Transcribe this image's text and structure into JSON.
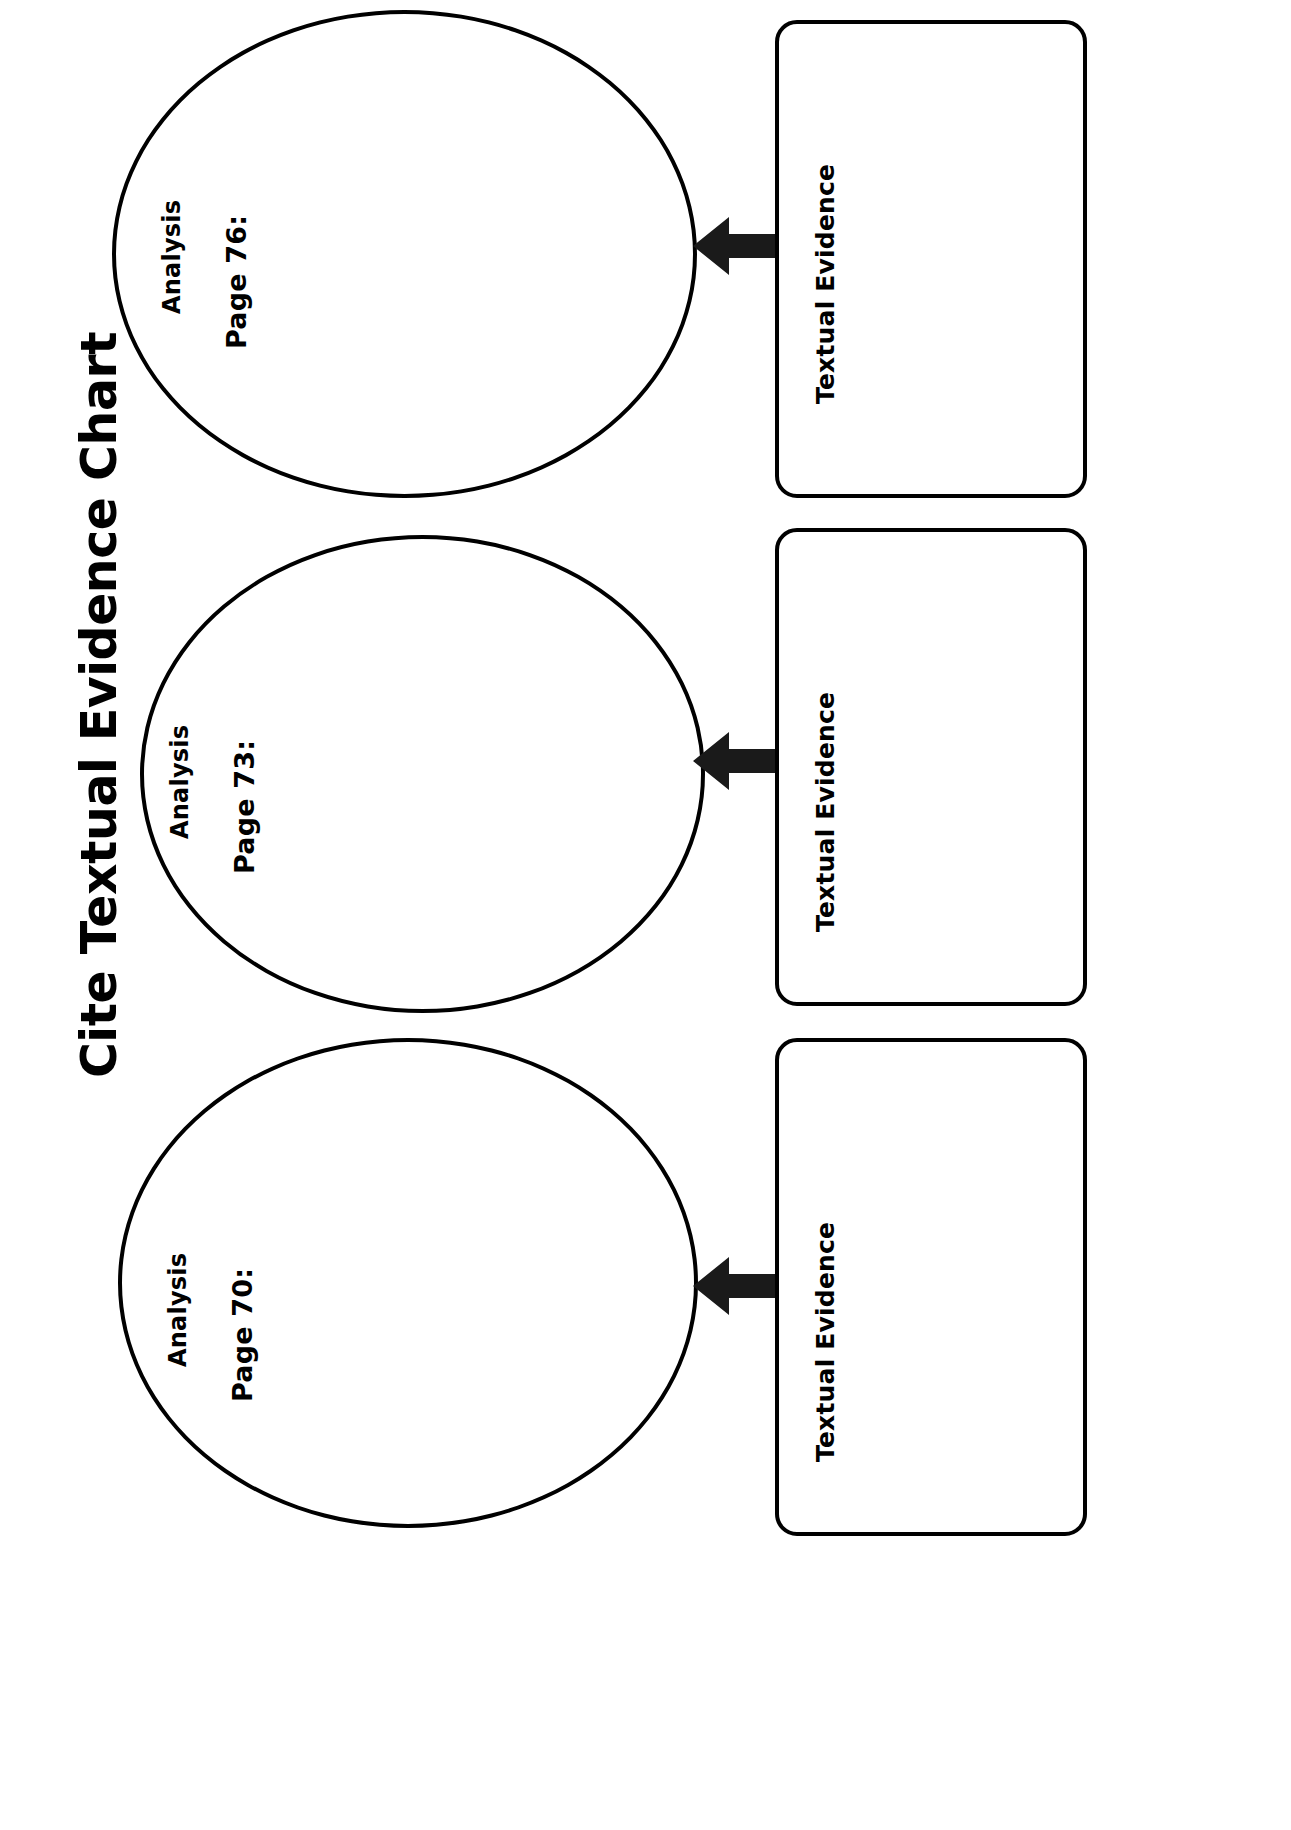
{
  "page": {
    "title": "Cite Textual Evidence Chart",
    "orientation": "rotated-90",
    "background_color": "#ffffff",
    "ink_color": "#000000"
  },
  "groups": [
    {
      "id": "group-page-70",
      "ellipse": {
        "heading": "Analysis",
        "page_label": "Page 70:",
        "content": ""
      },
      "evidence_box": {
        "label": "Textual Evidence",
        "content": ""
      },
      "arrow": {
        "icon": "arrow-left-icon",
        "direction": "left"
      }
    },
    {
      "id": "group-page-73",
      "ellipse": {
        "heading": "Analysis",
        "page_label": "Page 73:",
        "content": ""
      },
      "evidence_box": {
        "label": "Textual Evidence",
        "content": ""
      },
      "arrow": {
        "icon": "arrow-left-icon",
        "direction": "left"
      }
    },
    {
      "id": "group-page-76",
      "ellipse": {
        "heading": "Analysis",
        "page_label": "Page 76:",
        "content": ""
      },
      "evidence_box": {
        "label": "Textual Evidence",
        "content": ""
      },
      "arrow": {
        "icon": "arrow-left-icon",
        "direction": "left"
      }
    }
  ]
}
